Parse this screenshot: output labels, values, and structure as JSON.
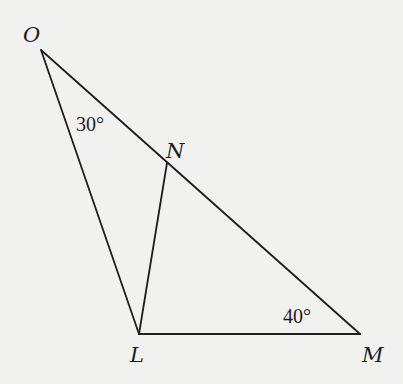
{
  "figure": {
    "type": "triangle-diagram",
    "background_color": "#f1f1f0",
    "line_color": "#1e1e1e",
    "vertices": {
      "O": {
        "label": "O",
        "x": 41,
        "y": 50
      },
      "N": {
        "label": "N",
        "x": 167,
        "y": 163
      },
      "L": {
        "label": "L",
        "x": 139,
        "y": 334
      },
      "M": {
        "label": "M",
        "x": 360,
        "y": 334
      }
    },
    "segments": [
      {
        "name": "OM",
        "from": "O",
        "to": "M"
      },
      {
        "name": "OL",
        "from": "O",
        "to": "L"
      },
      {
        "name": "LM",
        "from": "L",
        "to": "M"
      },
      {
        "name": "LN",
        "from": "L",
        "to": "N"
      }
    ],
    "angles": [
      {
        "vertex": "O",
        "label": "30°"
      },
      {
        "vertex": "M",
        "label": "40°"
      }
    ]
  }
}
